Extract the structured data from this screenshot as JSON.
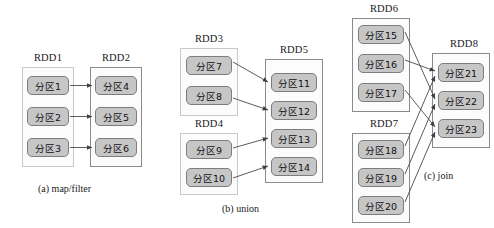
{
  "figure": {
    "panels": [
      {
        "id": "map-filter",
        "caption": "(a)  map/filter",
        "groups": [
          {
            "id": "rdd1",
            "title": "RDD1",
            "border": "light",
            "partitions": [
              "分区1",
              "分区2",
              "分区3"
            ]
          },
          {
            "id": "rdd2",
            "title": "RDD2",
            "border": "dark",
            "partitions": [
              "分区4",
              "分区5",
              "分区6"
            ]
          }
        ],
        "edges": [
          {
            "from": "分区1",
            "to": "分区4"
          },
          {
            "from": "分区2",
            "to": "分区5"
          },
          {
            "from": "分区3",
            "to": "分区6"
          }
        ]
      },
      {
        "id": "union",
        "caption": "(b)  union",
        "groups": [
          {
            "id": "rdd3",
            "title": "RDD3",
            "border": "light",
            "partitions": [
              "分区7",
              "分区8"
            ]
          },
          {
            "id": "rdd4",
            "title": "RDD4",
            "border": "light",
            "partitions": [
              "分区9",
              "分区10"
            ]
          },
          {
            "id": "rdd5",
            "title": "RDD5",
            "border": "dark",
            "partitions": [
              "分区11",
              "分区12",
              "分区13",
              "分区14"
            ]
          }
        ],
        "edges": [
          {
            "from": "分区7",
            "to": "分区11"
          },
          {
            "from": "分区8",
            "to": "分区12"
          },
          {
            "from": "分区9",
            "to": "分区13"
          },
          {
            "from": "分区10",
            "to": "分区14"
          }
        ]
      },
      {
        "id": "join",
        "caption": "(c)  join",
        "groups": [
          {
            "id": "rdd6",
            "title": "RDD6",
            "border": "dark",
            "partitions": [
              "分区15",
              "分区16",
              "分区17"
            ]
          },
          {
            "id": "rdd7",
            "title": "RDD7",
            "border": "dark",
            "partitions": [
              "分区18",
              "分区19",
              "分区20"
            ]
          },
          {
            "id": "rdd8",
            "title": "RDD8",
            "border": "dark",
            "partitions": [
              "分区21",
              "分区22",
              "分区23"
            ]
          }
        ],
        "edges": [
          {
            "from": "分区15",
            "to": "分区22"
          },
          {
            "from": "分区16",
            "to": "分区21"
          },
          {
            "from": "分区17",
            "to": "分区23"
          },
          {
            "from": "分区18",
            "to": "分区21"
          },
          {
            "from": "分区19",
            "to": "分区22"
          },
          {
            "from": "分区20",
            "to": "分区23"
          }
        ]
      }
    ]
  },
  "colors": {
    "partition_fill": "#c6c6c6",
    "partition_border": "#7d7d7d",
    "container_border_light": "#c9c9c9",
    "container_border_dark": "#8a8a8a",
    "arrow": "#4a4a4a",
    "text": "#111111",
    "background": "#ffffff"
  }
}
